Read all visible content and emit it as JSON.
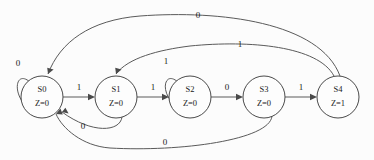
{
  "diagram": {
    "type": "state-transition-diagram",
    "width": 374,
    "height": 160,
    "background_color": "#fcfcfc",
    "stroke_color": "#5a5a5a",
    "text_color": "#1a1a1a"
  },
  "states": [
    {
      "id": "S0",
      "name": "S0",
      "output": "Z=0",
      "cx": 42,
      "cy": 97,
      "r": 21
    },
    {
      "id": "S1",
      "name": "S1",
      "output": "Z=0",
      "cx": 116,
      "cy": 97,
      "r": 21
    },
    {
      "id": "S2",
      "name": "S2",
      "output": "Z=0",
      "cx": 190,
      "cy": 97,
      "r": 21
    },
    {
      "id": "S3",
      "name": "S3",
      "output": "Z=0",
      "cx": 264,
      "cy": 97,
      "r": 21
    },
    {
      "id": "S4",
      "name": "S4",
      "output": "Z=1",
      "cx": 338,
      "cy": 97,
      "r": 21
    }
  ],
  "transitions": [
    {
      "id": "t-s0-s0",
      "from": "S0",
      "to": "S0",
      "input": "0",
      "label_x": 18,
      "label_y": 64
    },
    {
      "id": "t-s0-s1",
      "from": "S0",
      "to": "S1",
      "input": "1",
      "label_x": 79,
      "label_y": 88
    },
    {
      "id": "t-s1-s2",
      "from": "S1",
      "to": "S2",
      "input": "1",
      "label_x": 153,
      "label_y": 88
    },
    {
      "id": "t-s2-s2",
      "from": "S2",
      "to": "S2",
      "input": "1",
      "label_x": 166,
      "label_y": 62
    },
    {
      "id": "t-s2-s3",
      "from": "S2",
      "to": "S3",
      "input": "0",
      "label_x": 227,
      "label_y": 88
    },
    {
      "id": "t-s3-s4",
      "from": "S3",
      "to": "S4",
      "input": "1",
      "label_x": 301,
      "label_y": 88
    },
    {
      "id": "t-s4-s0",
      "from": "S4",
      "to": "S0",
      "input": "0",
      "label_x": 198,
      "label_y": 16
    },
    {
      "id": "t-s4-s1",
      "from": "S4",
      "to": "S1",
      "input": "1",
      "label_x": 240,
      "label_y": 45
    },
    {
      "id": "t-s1-s0",
      "from": "S1",
      "to": "S0",
      "input": "0",
      "label_x": 83,
      "label_y": 127
    },
    {
      "id": "t-s3-s0",
      "from": "S3",
      "to": "S0",
      "input": "0",
      "label_x": 165,
      "label_y": 143
    }
  ],
  "geometry": {
    "edge_s0_self": "M 30 82 C 16 70, 12 92, 26 106",
    "edge_s0_s1": "M 63 97 L 90 97",
    "edge_s1_s2": "M 137 97 L 164 97",
    "edge_s2_self": "M 178 82 C 164 70, 160 92, 174 104",
    "edge_s2_s3": "M 211 97 L 238 97",
    "edge_s3_s4": "M 285 97 L 312 97",
    "edge_s4_s0": "M 340 76 C 320 22, 220 10, 140 16 C 90 20, 60 42, 48 74",
    "edge_s4_s1": "M 334 76 C 318 46, 250 40, 190 46 C 158 50, 128 58, 116 74",
    "edge_s1_s0": "M 122 117 C 120 132, 92 134, 62 112",
    "edge_s3_s0": "M 272 116 C 270 140, 180 152, 110 148 C 82 146, 62 128, 56 114",
    "arrow_s0_self": "M 26 106 l 1.5 -6.5 l 4.5 4.2 z",
    "arrow_s0_s1": "M 95 97 l -7 -3.2 l 0 6.4 z",
    "arrow_s1_s2": "M 169 97 l -7 -3.2 l 0 6.4 z",
    "arrow_s2_self": "M 174 104 l 1.8 -6.3 l 4.4 4.6 z",
    "arrow_s2_s3": "M 243 97 l -7 -3.2 l 0 6.4 z",
    "arrow_s3_s4": "M 317 97 l -7 -3.2 l 0 6.4 z",
    "arrow_s4_s0": "M 48 74 l 5.6 -4.6 l -6.4 -1.6 z",
    "arrow_s4_s1": "M 116 74 l 5.6 -4.6 l -6.4 -1.6 z",
    "arrow_s1_s0": "M 62 112 l 6.6 1.4 l -3.2 -5.6 z",
    "arrow_s3_s0": "M 56 114 l 6.8 0.6 l -2.4 -6 z"
  }
}
